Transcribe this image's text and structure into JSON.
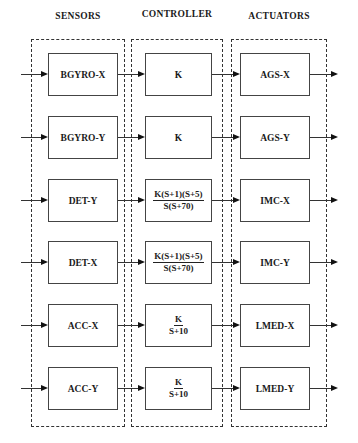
{
  "headers": {
    "sensors": "SENSORS",
    "controller": "CONTROLLER",
    "actuators": "ACTUATORS"
  },
  "rows": [
    {
      "sensor": "BGYRO-X",
      "controller": {
        "type": "text",
        "label": "K"
      },
      "actuator": "AGS-X"
    },
    {
      "sensor": "BGYRO-Y",
      "controller": {
        "type": "text",
        "label": "K"
      },
      "actuator": "AGS-Y"
    },
    {
      "sensor": "DET-Y",
      "controller": {
        "type": "fraction",
        "num": "K(S+1)(S+5)",
        "den": "S(S+70)"
      },
      "actuator": "IMC-X"
    },
    {
      "sensor": "DET-X",
      "controller": {
        "type": "fraction",
        "num": "K(S+1)(S+5)",
        "den": "S(S+70)"
      },
      "actuator": "IMC-Y"
    },
    {
      "sensor": "ACC-X",
      "controller": {
        "type": "fraction",
        "num": "K",
        "den": "S+10"
      },
      "actuator": "LMED-X"
    },
    {
      "sensor": "ACC-Y",
      "controller": {
        "type": "fraction",
        "num": "K",
        "den": "S+10"
      },
      "actuator": "LMED-Y"
    }
  ],
  "colors": {
    "line": "#333333",
    "background": "#ffffff"
  }
}
